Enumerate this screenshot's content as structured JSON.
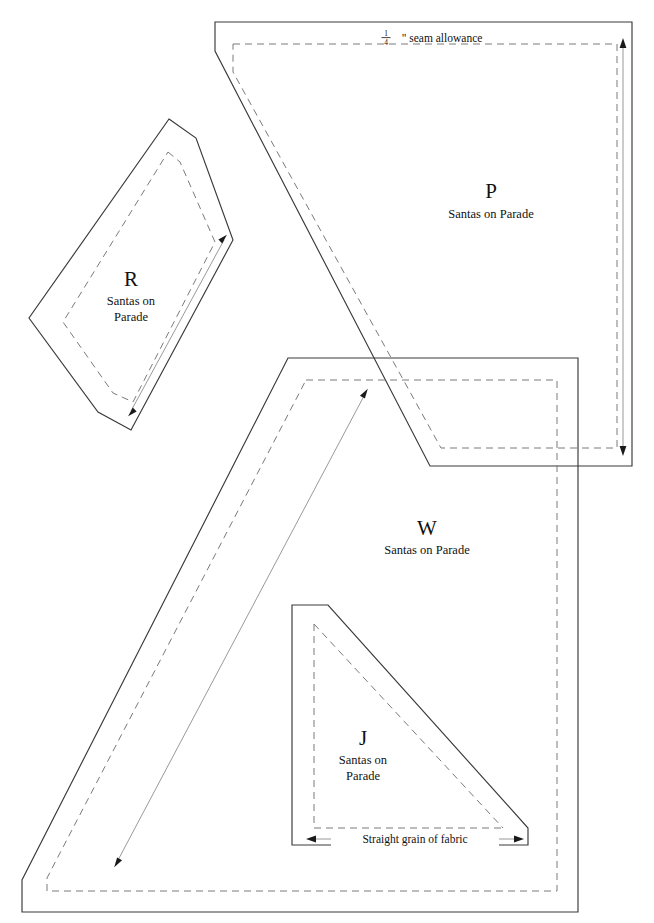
{
  "sheet": {
    "title": "Santas on Parade — quilt pattern template sheet",
    "background_color": "#ffffff",
    "cut_line_color": "#3a3a3a",
    "seam_line_color": "#7a7a7a",
    "grain_line_color": "#8d8d8d",
    "width": 654,
    "height": 923
  },
  "notes": {
    "seam_allowance": {
      "fraction_numerator": "1",
      "fraction_denominator": "4",
      "text": "\" seam allowance",
      "full_text": "1/4\" seam allowance"
    },
    "straight_grain": {
      "label": "Straight grain of fabric"
    }
  },
  "pieces": [
    {
      "id": "P",
      "letter": "P",
      "pattern_name": "Santas on Parade",
      "name_lines": [
        "Santas on Parade"
      ],
      "grain_direction": "vertical",
      "cut_points": "215,22 632,22 632,466 430,466 215,51",
      "seam_points": "233,44 617,44 617,448 441,448 233,72",
      "grain_line": {
        "x1": 623,
        "y1": 44,
        "x2": 623,
        "y2": 450
      }
    },
    {
      "id": "R",
      "letter": "R",
      "pattern_name": "Santas on Parade",
      "name_lines": [
        "Santas on",
        "Parade"
      ],
      "grain_direction": "diagonal",
      "cut_points": "169,119 196,138 233,240 131,430 98,412 29,318",
      "seam_points": "168,152 180,162 215,242 133,402 113,393 63,322",
      "grain_line": {
        "x1": 131,
        "y1": 411,
        "x2": 224,
        "y2": 240
      }
    },
    {
      "id": "W",
      "letter": "W",
      "pattern_name": "Santas on Parade",
      "name_lines": [
        "Santas on Parade"
      ],
      "grain_direction": "diagonal",
      "cut_points": "288,358 578,358 578,912 22,912 22,880",
      "seam_points": "306,380 557,380 557,891 47,891 47,878",
      "grain_line": {
        "x1": 117,
        "y1": 862,
        "x2": 365,
        "y2": 394
      }
    },
    {
      "id": "J",
      "letter": "J",
      "pattern_name": "Santas on Parade",
      "name_lines": [
        "Santas on",
        "Parade"
      ],
      "grain_direction": "horizontal",
      "cut_points": "292,605 328,605 528,828 528,845 292,845",
      "seam_points": "314,624 314,828 503,828",
      "grain_line": {
        "x1": 312,
        "y1": 839,
        "x2": 518,
        "y2": 839
      }
    }
  ],
  "labels": {
    "P": {
      "letter_x": 491,
      "letter_y": 198,
      "name_x": 491,
      "name_y": 218
    },
    "R": {
      "letter_x": 131,
      "letter_y": 286,
      "name_x": 131,
      "name_y": 305,
      "name2_y": 321
    },
    "W": {
      "letter_x": 427,
      "letter_y": 535,
      "name_x": 427,
      "name_y": 554
    },
    "J": {
      "letter_x": 363,
      "letter_y": 745,
      "name_x": 363,
      "name_y": 764,
      "name2_y": 780
    }
  }
}
